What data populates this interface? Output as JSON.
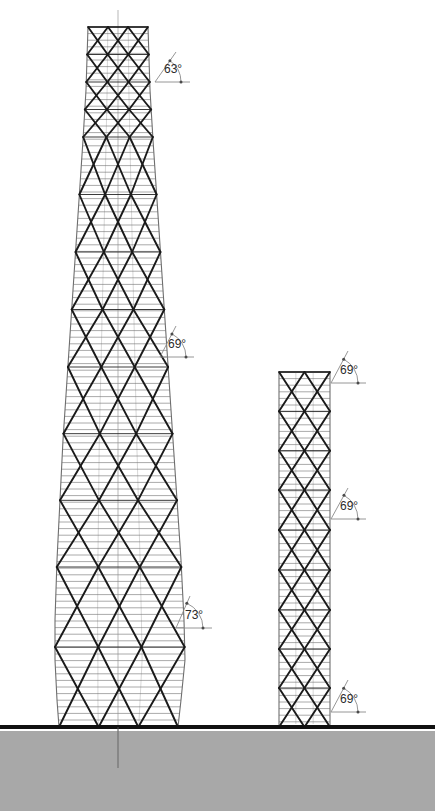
{
  "drawing": {
    "title": "Tower Diagrid Elevation Comparison",
    "type": "architectural-elevation",
    "canvas": {
      "width": 435,
      "height": 811
    },
    "colors": {
      "background": "#ffffff",
      "ground_fill": "#a8a8a8",
      "ground_line": "#111111",
      "diagrid_line": "#1a1a1a",
      "floor_line": "#8d8d8d",
      "envelope_line": "#6e6e6e",
      "annotation_line": "#8a8a8a",
      "annotation_text": "#2b2b2b",
      "centerline": "#9a9a9a"
    },
    "ground": {
      "name": "ground-plane",
      "line_y": 727,
      "line_thickness": 4,
      "fill_top": 731,
      "fill_bottom": 811
    },
    "centerline": {
      "x": 118,
      "top": 10,
      "bottom": 768
    }
  },
  "towers": [
    {
      "id": "tower-left",
      "label": "Left tapered diagrid tower",
      "base_y": 727,
      "top_y": 27,
      "profile": [
        {
          "y": 27,
          "left": 88,
          "right": 148
        },
        {
          "y": 90,
          "left": 86,
          "right": 150
        },
        {
          "y": 140,
          "left": 83,
          "right": 153
        },
        {
          "y": 200,
          "left": 79,
          "right": 157
        },
        {
          "y": 260,
          "left": 75,
          "right": 161
        },
        {
          "y": 320,
          "left": 71,
          "right": 165
        },
        {
          "y": 380,
          "left": 67,
          "right": 169
        },
        {
          "y": 440,
          "left": 63,
          "right": 173
        },
        {
          "y": 500,
          "left": 60,
          "right": 177
        },
        {
          "y": 560,
          "left": 57,
          "right": 181
        },
        {
          "y": 620,
          "left": 55,
          "right": 184
        },
        {
          "y": 660,
          "left": 55,
          "right": 185
        },
        {
          "y": 700,
          "left": 57,
          "right": 181
        },
        {
          "y": 727,
          "left": 59,
          "right": 178
        }
      ],
      "zones": [
        {
          "name": "crown-zone",
          "top": 27,
          "bottom": 137,
          "bays": 3,
          "modules": 4,
          "angle_deg": 63
        },
        {
          "name": "upper-zone",
          "top": 137,
          "bottom": 367,
          "bays": 3,
          "modules": 4,
          "angle_deg": 69
        },
        {
          "name": "middle-zone",
          "top": 367,
          "bottom": 567,
          "bays": 3,
          "modules": 3,
          "angle_deg": 69
        },
        {
          "name": "lower-zone",
          "top": 567,
          "bottom": 727,
          "bays": 3,
          "modules": 2,
          "angle_deg": 73
        }
      ],
      "floor_line_spacing": 6.6
    },
    {
      "id": "tower-right",
      "label": "Right prismatic diagrid tower",
      "base_y": 727,
      "top_y": 372,
      "profile": [
        {
          "y": 372,
          "left": 279,
          "right": 330
        },
        {
          "y": 727,
          "left": 279,
          "right": 330
        }
      ],
      "zones": [
        {
          "name": "upper-zone",
          "top": 372,
          "bottom": 490,
          "bays": 2,
          "modules": 3,
          "angle_deg": 69
        },
        {
          "name": "middle-zone",
          "top": 490,
          "bottom": 610,
          "bays": 2,
          "modules": 3,
          "angle_deg": 69
        },
        {
          "name": "lower-zone",
          "top": 610,
          "bottom": 727,
          "bays": 2,
          "modules": 3,
          "angle_deg": 69
        }
      ],
      "floor_line_spacing": 6.6
    }
  ],
  "annotations": [
    {
      "id": "angle-63-left-crown",
      "text": "63°",
      "value": 63,
      "unit": "degrees",
      "tower": "tower-left",
      "vertex": {
        "x": 155,
        "y": 82
      },
      "ray_diagonal_end": {
        "x": 176,
        "y": 52
      },
      "ray_horizontal_end": {
        "x": 190,
        "y": 82
      },
      "arc_radius": 26,
      "label_pos": {
        "x": 164,
        "y": 73
      }
    },
    {
      "id": "angle-69-left-upper",
      "text": "69°",
      "value": 69,
      "unit": "degrees",
      "tower": "tower-left",
      "vertex": {
        "x": 160,
        "y": 357
      },
      "ray_diagonal_end": {
        "x": 176,
        "y": 326
      },
      "ray_horizontal_end": {
        "x": 194,
        "y": 357
      },
      "arc_radius": 26,
      "label_pos": {
        "x": 168,
        "y": 348
      }
    },
    {
      "id": "angle-73-left-lower",
      "text": "73°",
      "value": 73,
      "unit": "degrees",
      "tower": "tower-left",
      "vertex": {
        "x": 176,
        "y": 628
      },
      "ray_diagonal_end": {
        "x": 190,
        "y": 596
      },
      "ray_horizontal_end": {
        "x": 212,
        "y": 628
      },
      "arc_radius": 27,
      "label_pos": {
        "x": 185,
        "y": 619
      }
    },
    {
      "id": "angle-69-right-upper",
      "text": "69°",
      "value": 69,
      "unit": "degrees",
      "tower": "tower-right",
      "vertex": {
        "x": 331,
        "y": 383
      },
      "ray_diagonal_end": {
        "x": 348,
        "y": 351
      },
      "ray_horizontal_end": {
        "x": 366,
        "y": 383
      },
      "arc_radius": 27,
      "label_pos": {
        "x": 340,
        "y": 374
      }
    },
    {
      "id": "angle-69-right-middle",
      "text": "69°",
      "value": 69,
      "unit": "degrees",
      "tower": "tower-right",
      "vertex": {
        "x": 331,
        "y": 519
      },
      "ray_diagonal_end": {
        "x": 348,
        "y": 488
      },
      "ray_horizontal_end": {
        "x": 366,
        "y": 519
      },
      "arc_radius": 27,
      "label_pos": {
        "x": 340,
        "y": 510
      }
    },
    {
      "id": "angle-69-right-lower",
      "text": "69°",
      "value": 69,
      "unit": "degrees",
      "tower": "tower-right",
      "vertex": {
        "x": 331,
        "y": 712
      },
      "ray_diagonal_end": {
        "x": 348,
        "y": 680
      },
      "ray_horizontal_end": {
        "x": 366,
        "y": 712
      },
      "arc_radius": 27,
      "label_pos": {
        "x": 340,
        "y": 703
      }
    }
  ]
}
